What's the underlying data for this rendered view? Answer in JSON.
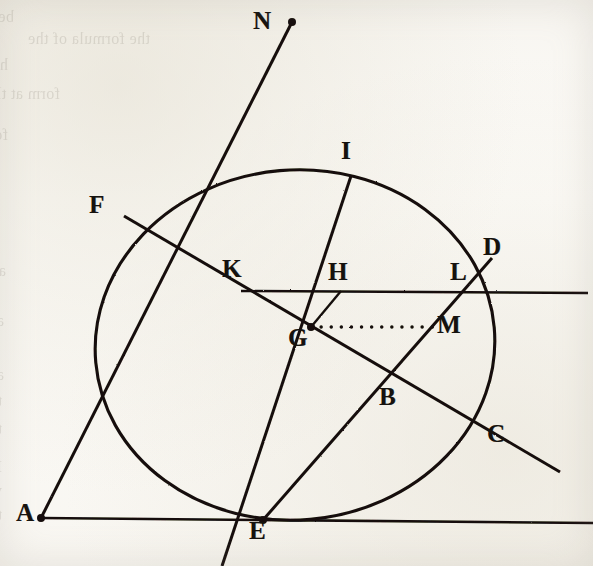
{
  "figure": {
    "kind": "geometric-construction",
    "medium": "scanned book page, ink line engraving",
    "ink_color": "#141109",
    "paper_color": "#faf8f4",
    "canvas": {
      "width": 593,
      "height": 566
    },
    "ellipse": {
      "center_x": 295,
      "center_y": 345,
      "radius_x": 200,
      "radius_y": 175,
      "rotation_deg": -5
    },
    "points": [
      {
        "id": "N",
        "label": "N",
        "x": 292,
        "y": 22,
        "label_x": 253,
        "label_y": 8,
        "has_dot": true
      },
      {
        "id": "I",
        "label": "I",
        "x": 351,
        "y": 176,
        "label_x": 341,
        "label_y": 138,
        "has_dot": false
      },
      {
        "id": "F",
        "label": "F",
        "x": 124,
        "y": 216,
        "label_x": 89,
        "label_y": 192,
        "has_dot": false
      },
      {
        "id": "D",
        "label": "D",
        "x": 487,
        "y": 264,
        "label_x": 483,
        "label_y": 234,
        "has_dot": false
      },
      {
        "id": "K",
        "label": "K",
        "x": 241,
        "y": 291,
        "label_x": 222,
        "label_y": 256,
        "has_dot": false
      },
      {
        "id": "H",
        "label": "H",
        "x": 341,
        "y": 291,
        "label_x": 328,
        "label_y": 259,
        "has_dot": false
      },
      {
        "id": "L",
        "label": "L",
        "x": 466,
        "y": 291,
        "label_x": 450,
        "label_y": 259,
        "has_dot": false
      },
      {
        "id": "G",
        "label": "G",
        "x": 311,
        "y": 327,
        "label_x": 288,
        "label_y": 325,
        "has_dot": true
      },
      {
        "id": "M",
        "label": "M",
        "x": 433,
        "y": 327,
        "label_x": 437,
        "label_y": 312,
        "has_dot": false
      },
      {
        "id": "B",
        "label": "B",
        "x": 394,
        "y": 385,
        "label_x": 379,
        "label_y": 384,
        "has_dot": false
      },
      {
        "id": "C",
        "label": "C",
        "x": 489,
        "y": 440,
        "label_x": 487,
        "label_y": 421,
        "has_dot": false
      },
      {
        "id": "A",
        "label": "A",
        "x": 41,
        "y": 518,
        "label_x": 16,
        "label_y": 500,
        "has_dot": true
      },
      {
        "id": "E",
        "label": "E",
        "x": 263,
        "y": 520,
        "label_x": 249,
        "label_y": 518,
        "has_dot": true
      }
    ],
    "segments": [
      {
        "id": "line-N-A",
        "from": "N",
        "to": "A",
        "x1": 292,
        "y1": 22,
        "x2": 41,
        "y2": 518,
        "style": "solid",
        "width": 3.0,
        "note": "long oblique from N down through the ellipse to A"
      },
      {
        "id": "line-A-base",
        "from": "A",
        "to": "right-edge",
        "x1": 41,
        "y1": 518,
        "x2": 593,
        "y2": 523,
        "style": "solid",
        "width": 2.6,
        "note": "horizontal base line through E"
      },
      {
        "id": "line-E-D",
        "from": "E",
        "to": "D",
        "x1": 263,
        "y1": 520,
        "x2": 492,
        "y2": 258,
        "style": "solid",
        "width": 3.0,
        "note": "oblique from E up through M, L to D"
      },
      {
        "id": "line-F-C",
        "from": "F",
        "to": "C",
        "x1": 124,
        "y1": 216,
        "x2": 560,
        "y2": 472,
        "style": "solid",
        "width": 3.0,
        "note": "oblique from F down through K, G, B to C and beyond"
      },
      {
        "id": "line-I-low",
        "from": "I",
        "to": "lower-left",
        "x1": 351,
        "y1": 176,
        "x2": 222,
        "y2": 566,
        "style": "solid",
        "width": 3.0,
        "note": "oblique from I on the ellipse descending to lower left"
      },
      {
        "id": "line-K-axis",
        "from": "K",
        "to": "right-edge",
        "x1": 241,
        "y1": 291,
        "x2": 588,
        "y2": 293,
        "style": "solid",
        "width": 2.4,
        "note": "horizontal chord from K through H and L"
      },
      {
        "id": "line-H-G",
        "from": "H",
        "to": "G",
        "x1": 341,
        "y1": 291,
        "x2": 311,
        "y2": 327,
        "style": "solid",
        "width": 2.4,
        "note": "short segment dropping from H to G"
      },
      {
        "id": "line-G-M",
        "from": "G",
        "to": "M",
        "x1": 311,
        "y1": 327,
        "x2": 433,
        "y2": 327,
        "style": "dotted",
        "width": 3.4,
        "note": "dotted horizontal from G to M"
      }
    ],
    "bleed_text": [
      {
        "text": "be centre of gravity",
        "x": 14,
        "y": 8,
        "size": 16
      },
      {
        "text": "the formula of the",
        "x": 150,
        "y": 30,
        "size": 16
      },
      {
        "text": "has to be reduced that the",
        "x": 8,
        "y": 56,
        "size": 16
      },
      {
        "text": "form at the centre",
        "x": 60,
        "y": 85,
        "size": 16
      },
      {
        "text": "for the centre of motion will be",
        "x": 8,
        "y": 126,
        "size": 16
      },
      {
        "text": "as we find it, we perceive the la",
        "x": 6,
        "y": 262,
        "size": 16
      },
      {
        "text": "and to reason from it",
        "x": 4,
        "y": 312,
        "size": 16
      },
      {
        "text": "and to describe the ellipse with",
        "x": 4,
        "y": 366,
        "size": 16
      },
      {
        "text": "the focus, and which must again be produc",
        "x": 2,
        "y": 392,
        "size": 16
      },
      {
        "text": "the equation used 373 b",
        "x": 2,
        "y": 420,
        "size": 16
      },
      {
        "text": "If we take the centre of motion",
        "x": 2,
        "y": 458,
        "size": 16
      },
      {
        "text": "which then passes through the difference",
        "x": 2,
        "y": 482,
        "size": 16
      },
      {
        "text": "the centre in the ellipse",
        "x": 2,
        "y": 506,
        "size": 16
      }
    ]
  }
}
